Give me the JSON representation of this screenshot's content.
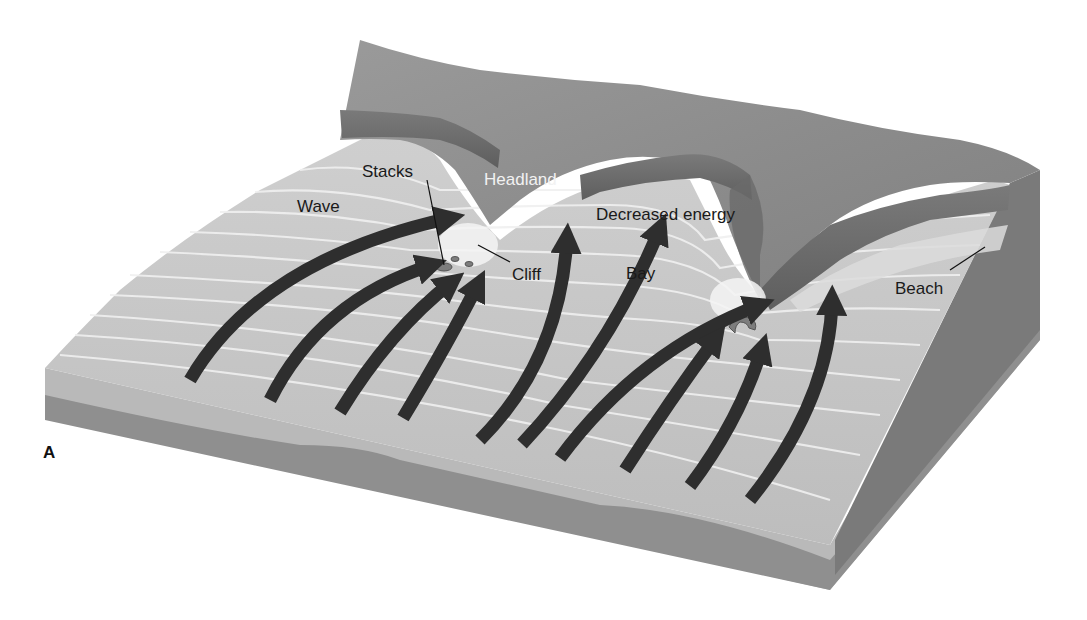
{
  "figure": {
    "panel_label": "A",
    "labels": {
      "wave": "Wave",
      "stacks": "Stacks",
      "headland": "Headland",
      "decreased_energy": "Decreased energy",
      "cliff": "Cliff",
      "bay": "Bay",
      "beach": "Beach"
    },
    "colors": {
      "background": "#ffffff",
      "water": "#c4c4c4",
      "water_crests": "#ececec",
      "land_top": "#8e8e8e",
      "cliff_face": "#6f6f6f",
      "block_side_upper": "#b9b9b9",
      "block_side_lower": "#8a8a8a",
      "block_right_face": "#7a7a7a",
      "arrow": "#2e2e2e",
      "stack": "#7d7d7d"
    },
    "arrow_count": 12
  }
}
